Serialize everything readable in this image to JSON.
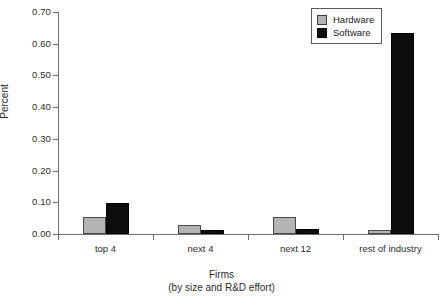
{
  "chart_data": {
    "type": "bar",
    "title": "",
    "xlabel": "Firms",
    "xlabel_line2": "(by size and R&D effort)",
    "ylabel": "Percent",
    "ylim": [
      0.0,
      0.7
    ],
    "ytick_labels": [
      "0.00",
      "0.10",
      "0.20",
      "0.30",
      "0.40",
      "0.50",
      "0.60",
      "0.70"
    ],
    "ytick_values": [
      0.0,
      0.1,
      0.2,
      0.3,
      0.4,
      0.5,
      0.6,
      0.7
    ],
    "grid": false,
    "legend_position": "top-right",
    "categories": [
      "top 4",
      "next 4",
      "next 12",
      "rest of industry"
    ],
    "series": [
      {
        "name": "Hardware",
        "color": "#b4b4b4",
        "values": [
          0.053,
          0.03,
          0.054,
          0.012
        ]
      },
      {
        "name": "Software",
        "color": "#0d0d0d",
        "values": [
          0.098,
          0.012,
          0.015,
          0.635
        ]
      }
    ]
  },
  "legend": {
    "items": [
      {
        "label": "Hardware",
        "swatch": "hardware-swatch"
      },
      {
        "label": "Software",
        "swatch": "software-swatch"
      }
    ]
  }
}
